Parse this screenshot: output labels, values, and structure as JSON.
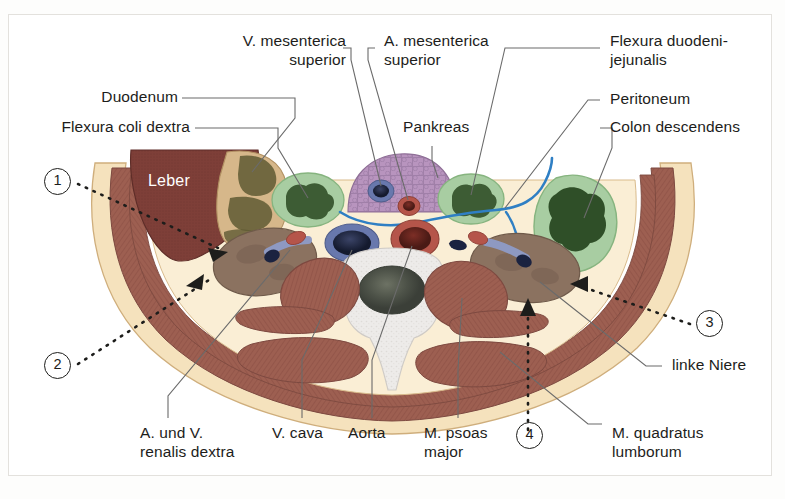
{
  "figure": {
    "type": "anatomical-cross-section",
    "region": "abdomen-transverse-section",
    "language": "de",
    "organ_inline_label": "Leber"
  },
  "labels": {
    "v_mesenterica_superior": "V. mesenterica\nsuperior",
    "a_mesenterica_superior": "A. mesenterica\nsuperior",
    "flexura_duodeni_jejunalis": "Flexura duodeni-\njejunalis",
    "duodenum": "Duodenum",
    "flexura_coli_dextra": "Flexura coli dextra",
    "pankreas": "Pankreas",
    "peritoneum": "Peritoneum",
    "colon_descendens": "Colon descendens",
    "linke_niere": "linke Niere",
    "a_und_v_renalis_dextra": "A. und V.\nrenalis dextra",
    "v_cava": "V. cava",
    "aorta": "Aorta",
    "m_psoas_major": "M. psoas\nmajor",
    "m_quadratus_lumborum": "M. quadratus\nlumborum"
  },
  "markers": [
    {
      "id": "1",
      "number": "1"
    },
    {
      "id": "2",
      "number": "2"
    },
    {
      "id": "3",
      "number": "3"
    },
    {
      "id": "4",
      "number": "4"
    }
  ],
  "colors": {
    "muscle": "#9d5f51",
    "muscle_dark": "#8a5246",
    "fat": "#f5e2bd",
    "fat_light": "#faeed5",
    "liver": "#7e3f38",
    "kidney": "#8b7260",
    "pancreas": "#b894be",
    "bowel_green": "#a8cda2",
    "bowel_content": "#3d5c34",
    "duodenum": "#d6b78a",
    "vein_blue": "#6878ad",
    "artery_red": "#b5554a",
    "bone": "#eceae8",
    "peritoneum_line": "#2f7fc4",
    "leader": "#6b6b6b",
    "text": "#1d1d1b",
    "frame": "#e3e1dd"
  }
}
